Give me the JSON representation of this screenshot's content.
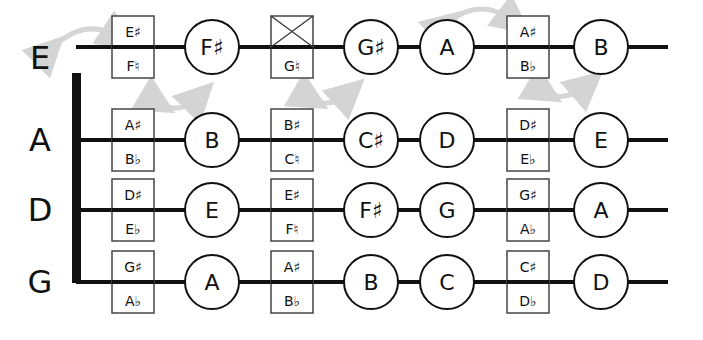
{
  "strings": [
    {
      "name": "E",
      "y": 47,
      "positions": [
        {
          "type": "box",
          "x": 133,
          "top": "E♯",
          "bottom": "F♮"
        },
        {
          "type": "circle",
          "x": 212,
          "label": "F♯"
        },
        {
          "type": "box-crossed",
          "x": 292,
          "top": "",
          "bottom": "G♮"
        },
        {
          "type": "circle",
          "x": 371,
          "label": "G♯"
        },
        {
          "type": "circle",
          "x": 447,
          "label": "A"
        },
        {
          "type": "box",
          "x": 528,
          "top": "A♯",
          "bottom": "B♭"
        },
        {
          "type": "circle",
          "x": 601,
          "label": "B"
        }
      ]
    },
    {
      "name": "A",
      "y": 140,
      "positions": [
        {
          "type": "box",
          "x": 133,
          "top": "A♯",
          "bottom": "B♭"
        },
        {
          "type": "circle",
          "x": 212,
          "label": "B"
        },
        {
          "type": "box",
          "x": 292,
          "top": "B♯",
          "bottom": "C♮"
        },
        {
          "type": "circle",
          "x": 371,
          "label": "C♯"
        },
        {
          "type": "circle",
          "x": 447,
          "label": "D"
        },
        {
          "type": "box",
          "x": 528,
          "top": "D♯",
          "bottom": "E♭"
        },
        {
          "type": "circle",
          "x": 601,
          "label": "E"
        }
      ]
    },
    {
      "name": "D",
      "y": 210,
      "positions": [
        {
          "type": "box",
          "x": 133,
          "top": "D♯",
          "bottom": "E♭"
        },
        {
          "type": "circle",
          "x": 212,
          "label": "E"
        },
        {
          "type": "box",
          "x": 292,
          "top": "E♯",
          "bottom": "F♮"
        },
        {
          "type": "circle",
          "x": 371,
          "label": "F♯"
        },
        {
          "type": "circle",
          "x": 447,
          "label": "G"
        },
        {
          "type": "box",
          "x": 528,
          "top": "G♯",
          "bottom": "A♭"
        },
        {
          "type": "circle",
          "x": 601,
          "label": "A"
        }
      ]
    },
    {
      "name": "G",
      "y": 282,
      "positions": [
        {
          "type": "box",
          "x": 133,
          "top": "G♯",
          "bottom": "A♭"
        },
        {
          "type": "circle",
          "x": 212,
          "label": "A"
        },
        {
          "type": "box",
          "x": 292,
          "top": "A♯",
          "bottom": "B♭"
        },
        {
          "type": "circle",
          "x": 371,
          "label": "B"
        },
        {
          "type": "circle",
          "x": 447,
          "label": "C"
        },
        {
          "type": "box",
          "x": 528,
          "top": "C♯",
          "bottom": "D♭"
        },
        {
          "type": "circle",
          "x": 601,
          "label": "D"
        }
      ]
    }
  ],
  "colors": {
    "line": "#111111",
    "arrow": "#d4d4d4",
    "box_border": "#444444",
    "background": "#ffffff"
  }
}
